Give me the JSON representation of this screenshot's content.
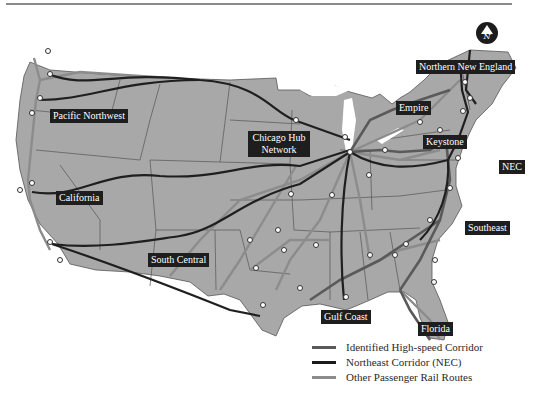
{
  "compass": {
    "label": "N",
    "icon": "north-arrow-icon"
  },
  "regions": [
    {
      "id": "northern-new-england",
      "label": "Northern New England",
      "x": 416,
      "y": 62
    },
    {
      "id": "pacific-northwest",
      "label": "Pacific Northwest",
      "x": 50,
      "y": 110
    },
    {
      "id": "empire",
      "label": "Empire",
      "x": 396,
      "y": 102
    },
    {
      "id": "chicago-hub",
      "label": "Chicago Hub Network",
      "x": 248,
      "y": 133
    },
    {
      "id": "keystone",
      "label": "Keystone",
      "x": 423,
      "y": 136
    },
    {
      "id": "nec",
      "label": "NEC",
      "x": 499,
      "y": 160
    },
    {
      "id": "california",
      "label": "California",
      "x": 56,
      "y": 192
    },
    {
      "id": "southeast",
      "label": "Southeast",
      "x": 465,
      "y": 222
    },
    {
      "id": "south-central",
      "label": "South Central",
      "x": 148,
      "y": 254
    },
    {
      "id": "gulf-coast",
      "label": "Gulf Coast",
      "x": 321,
      "y": 311
    },
    {
      "id": "florida",
      "label": "Florida",
      "x": 418,
      "y": 323
    }
  ],
  "legend": {
    "items": [
      {
        "label": "Identified High-speed Corridor",
        "color": "#5a5a5a"
      },
      {
        "label": "Northeast Corridor (NEC)",
        "color": "#1a1a1a"
      },
      {
        "label": "Other Passenger Rail Routes",
        "color": "#8c8c8c"
      }
    ]
  },
  "colors": {
    "land": "#a8a8a8",
    "state_border": "#555555",
    "water": "#ffffff",
    "route_dark": "#1f1f1f",
    "route_medium": "#5a5a5a",
    "route_light": "#8c8c8c"
  }
}
